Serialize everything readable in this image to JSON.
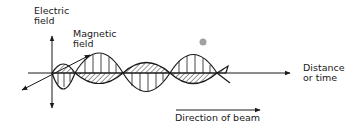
{
  "labels": {
    "electric_field": [
      "Electric",
      "field"
    ],
    "magnetic_field": [
      "Magnetic",
      "field"
    ],
    "distance_or_time": [
      "Distance",
      "or time"
    ],
    "direction_of_beam": "Direction of beam"
  },
  "colors": {
    "ink": "#1a1a1a",
    "background": "#ffffff",
    "dot": "#8a8a8a"
  }
}
